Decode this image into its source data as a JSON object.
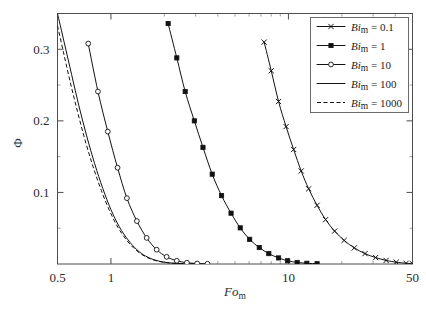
{
  "figure": {
    "name": "phi-vs-fom-log-plot",
    "background": "#ffffff",
    "frame_color": "#4d4d4d",
    "curve_color": "#111111"
  },
  "axes": {
    "x": {
      "label_main": "Fo",
      "label_sub": "m",
      "scale": "log",
      "min": 0.5,
      "max": 50,
      "tick_labels": [
        "0.5",
        "1",
        "10",
        "50"
      ],
      "tick_values": [
        0.5,
        1,
        10,
        50
      ],
      "minor_ticks": [
        2,
        3,
        4,
        5,
        6,
        7,
        8,
        9,
        20,
        30,
        40
      ]
    },
    "y": {
      "label": "Φ",
      "scale": "linear",
      "min": 0,
      "max": 0.35,
      "tick_labels": [
        "0.1",
        "0.2",
        "0.3"
      ],
      "tick_values": [
        0.1,
        0.2,
        0.3
      ],
      "minor_ticks": [
        0.05,
        0.15,
        0.25,
        0.35
      ]
    }
  },
  "legend": {
    "position": "top-right",
    "border_color": "#6a6a6a",
    "entries": [
      {
        "label_main": "Bi",
        "label_sub": "m",
        "equals": " = ",
        "value": "0.1",
        "marker": "cross",
        "line": "solid"
      },
      {
        "label_main": "Bi",
        "label_sub": "m",
        "equals": " = ",
        "value": "1",
        "marker": "filled-square",
        "line": "solid"
      },
      {
        "label_main": "Bi",
        "label_sub": "m",
        "equals": " = ",
        "value": "10",
        "marker": "open-circle",
        "line": "solid"
      },
      {
        "label_main": "Bi",
        "label_sub": "m",
        "equals": " = ",
        "value": "100",
        "marker": "none",
        "line": "solid"
      },
      {
        "label_main": "Bi",
        "label_sub": "m",
        "equals": " = ",
        "value": "1000",
        "marker": "none",
        "line": "dashed"
      }
    ]
  },
  "chart_data": {
    "type": "line",
    "title": "",
    "xlabel": "Fo_m",
    "ylabel": "Φ",
    "xscale": "log",
    "yscale": "linear",
    "xlim": [
      0.5,
      50
    ],
    "ylim": [
      0.0,
      0.35
    ],
    "grid": false,
    "legend_position": "top-right",
    "series": [
      {
        "name": "Bi_m = 0.1",
        "marker": "cross",
        "line": "solid",
        "points": [
          [
            7.3,
            0.31
          ],
          [
            8.0,
            0.27
          ],
          [
            8.8,
            0.227
          ],
          [
            9.7,
            0.192
          ],
          [
            10.7,
            0.16
          ],
          [
            11.8,
            0.13
          ],
          [
            13.0,
            0.105
          ],
          [
            14.5,
            0.082
          ],
          [
            16.2,
            0.062
          ],
          [
            18.2,
            0.046
          ],
          [
            20.6,
            0.033
          ],
          [
            23.5,
            0.0225
          ],
          [
            27.0,
            0.0145
          ],
          [
            31.0,
            0.009
          ],
          [
            35.5,
            0.005
          ],
          [
            40.5,
            0.0025
          ],
          [
            46.0,
            0.001
          ],
          [
            50.0,
            0.0004
          ]
        ]
      },
      {
        "name": "Bi_m = 1",
        "marker": "filled-square",
        "line": "solid",
        "points": [
          [
            2.1,
            0.336
          ],
          [
            2.35,
            0.288
          ],
          [
            2.62,
            0.241
          ],
          [
            2.95,
            0.2
          ],
          [
            3.3,
            0.163
          ],
          [
            3.72,
            0.1255
          ],
          [
            4.2,
            0.0955
          ],
          [
            4.75,
            0.071
          ],
          [
            5.35,
            0.0505
          ],
          [
            6.05,
            0.0345
          ],
          [
            6.85,
            0.023
          ],
          [
            7.75,
            0.0145
          ],
          [
            8.8,
            0.0085
          ],
          [
            9.9,
            0.0045
          ],
          [
            11.2,
            0.0022
          ],
          [
            12.7,
            0.001
          ],
          [
            14.5,
            0.0004
          ]
        ]
      },
      {
        "name": "Bi_m = 10",
        "marker": "open-circle",
        "line": "solid",
        "points": [
          [
            0.745,
            0.308
          ],
          [
            0.845,
            0.241
          ],
          [
            0.96,
            0.185
          ],
          [
            1.09,
            0.1345
          ],
          [
            1.23,
            0.092
          ],
          [
            1.4,
            0.06
          ],
          [
            1.59,
            0.0365
          ],
          [
            1.81,
            0.02
          ],
          [
            2.06,
            0.01
          ],
          [
            2.35,
            0.0045
          ],
          [
            2.68,
            0.0018
          ],
          [
            3.06,
            0.0007
          ],
          [
            3.5,
            0.0003
          ]
        ]
      },
      {
        "name": "Bi_m = 100",
        "marker": "none",
        "line": "solid",
        "points": [
          [
            0.5,
            0.35
          ],
          [
            0.545,
            0.31
          ],
          [
            0.6,
            0.265
          ],
          [
            0.66,
            0.221
          ],
          [
            0.73,
            0.179
          ],
          [
            0.81,
            0.14
          ],
          [
            0.9,
            0.1055
          ],
          [
            1.0,
            0.076
          ],
          [
            1.115,
            0.052
          ],
          [
            1.25,
            0.0335
          ],
          [
            1.4,
            0.02
          ],
          [
            1.57,
            0.011
          ],
          [
            1.77,
            0.0055
          ],
          [
            2.0,
            0.0025
          ],
          [
            2.27,
            0.001
          ],
          [
            2.6,
            0.0004
          ],
          [
            3.0,
            0.0002
          ]
        ]
      },
      {
        "name": "Bi_m = 1000",
        "marker": "none",
        "line": "dashed",
        "points": [
          [
            0.5,
            0.333
          ],
          [
            0.54,
            0.296
          ],
          [
            0.59,
            0.254
          ],
          [
            0.648,
            0.213
          ],
          [
            0.715,
            0.173
          ],
          [
            0.793,
            0.136
          ],
          [
            0.882,
            0.103
          ],
          [
            0.982,
            0.0745
          ],
          [
            1.095,
            0.0512
          ],
          [
            1.228,
            0.0331
          ],
          [
            1.378,
            0.0198
          ],
          [
            1.548,
            0.0109
          ],
          [
            1.748,
            0.0054
          ],
          [
            1.978,
            0.0025
          ],
          [
            2.248,
            0.001
          ],
          [
            2.578,
            0.0004
          ],
          [
            2.98,
            0.0002
          ]
        ]
      }
    ]
  }
}
